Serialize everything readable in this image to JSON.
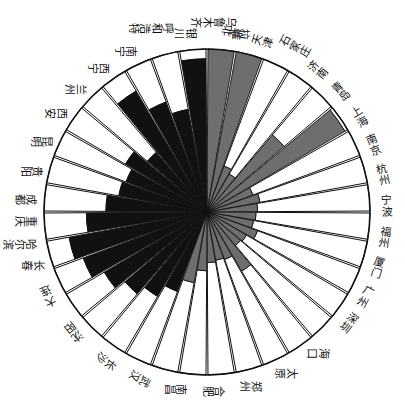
{
  "chart": {
    "title": "",
    "type_name": "radial-rose-chart",
    "center_x": 207,
    "center_y": 212,
    "outer_radius": 163,
    "start_angle_deg": -90,
    "sector_count": 36,
    "colors": {
      "fill_dark": "#111111",
      "fill_gray": "#6e6e6e",
      "fill_empty": "#ffffff",
      "stroke": "#111111",
      "label": "#111111",
      "background": "#ffffff"
    }
  },
  "chart_data": {
    "type": "bar",
    "title": "",
    "subtitle": "",
    "xlabel": "",
    "ylabel": "",
    "legend": [],
    "grid": false,
    "coordinate": "polar",
    "radial_max": 1.0,
    "note": "Each of 36 sectors is a city; value = inner filled radius as fraction of outer radius; group = fill color class",
    "categories": [
      "北京",
      "天津",
      "石家庄",
      "济南",
      "青岛",
      "上海",
      "南京",
      "杭州",
      "宁波",
      "福州",
      "厦门",
      "广州",
      "深圳",
      "海口",
      "太原",
      "郑州",
      "合肥",
      "南昌",
      "武汉",
      "长沙",
      "沈阳",
      "大连",
      "长春",
      "哈尔滨",
      "重庆",
      "成都",
      "贵阳",
      "昆明",
      "西安",
      "兰州",
      "西宁",
      "南宁",
      "呼和浩特",
      "银川",
      "乌鲁木齐",
      "拉萨"
    ],
    "values": [
      1.0,
      1.0,
      0.3,
      0.27,
      0.62,
      0.98,
      0.3,
      0.33,
      0.31,
      0.3,
      0.29,
      0.33,
      0.28,
      0.27,
      0.42,
      0.31,
      0.3,
      0.31,
      0.36,
      0.44,
      0.52,
      0.6,
      0.66,
      0.73,
      0.81,
      0.86,
      0.74,
      0.62,
      0.55,
      0.53,
      0.58,
      0.48,
      0.86,
      0.72,
      0.64,
      0.94
    ],
    "groups": [
      "gray",
      "gray",
      "gray",
      "gray",
      "gray",
      "gray",
      "gray",
      "gray",
      "gray",
      "gray",
      "gray",
      "gray",
      "gray",
      "gray",
      "gray",
      "gray",
      "gray",
      "gray",
      "gray",
      "gray",
      "dark",
      "dark",
      "dark",
      "dark",
      "dark",
      "dark",
      "dark",
      "dark",
      "dark",
      "dark",
      "dark",
      "dark",
      "dark",
      "dark",
      "dark",
      "dark"
    ],
    "series": [
      {
        "name": "inner-fill-fraction",
        "values": [
          1.0,
          1.0,
          0.3,
          0.27,
          0.62,
          0.98,
          0.3,
          0.33,
          0.31,
          0.3,
          0.29,
          0.33,
          0.28,
          0.27,
          0.42,
          0.31,
          0.3,
          0.31,
          0.36,
          0.44,
          0.52,
          0.6,
          0.66,
          0.73,
          0.81,
          0.86,
          0.74,
          0.62,
          0.55,
          0.53,
          0.58,
          0.48,
          0.86,
          0.72,
          0.64,
          0.94
        ]
      }
    ]
  },
  "labels": [
    {
      "text": "北京",
      "angle": -82,
      "rot": -82,
      "r": 182
    },
    {
      "text": "天津",
      "angle": -72,
      "rot": -72,
      "r": 180
    },
    {
      "text": "石家庄",
      "angle": -62,
      "rot": -62,
      "r": 188
    },
    {
      "text": "济南",
      "angle": -52,
      "rot": -52,
      "r": 180
    },
    {
      "text": "青岛",
      "angle": -42,
      "rot": -42,
      "r": 180
    },
    {
      "text": "上海",
      "angle": -32,
      "rot": -32,
      "r": 180
    },
    {
      "text": "南京",
      "angle": -22,
      "rot": -22,
      "r": 180
    },
    {
      "text": "杭州",
      "angle": -12,
      "rot": -12,
      "r": 180
    },
    {
      "text": "宁波",
      "angle": -2,
      "rot": -2,
      "r": 180
    },
    {
      "text": "福州",
      "angle": 8,
      "rot": 8,
      "r": 180
    },
    {
      "text": "厦门",
      "angle": 18,
      "rot": 18,
      "r": 180
    },
    {
      "text": "广州",
      "angle": 28,
      "rot": 28,
      "r": 180
    },
    {
      "text": "深圳",
      "angle": 38,
      "rot": 38,
      "r": 180
    },
    {
      "text": "海口",
      "angle": 52,
      "rot": 90,
      "r": 180
    },
    {
      "text": "太原",
      "angle": 64,
      "rot": 90,
      "r": 180
    },
    {
      "text": "郑州",
      "angle": 76,
      "rot": 90,
      "r": 180
    },
    {
      "text": "合肥",
      "angle": 88,
      "rot": 90,
      "r": 180
    },
    {
      "text": "南昌",
      "angle": 100,
      "rot": 90,
      "r": 180
    },
    {
      "text": "武汉",
      "angle": 112,
      "rot": 118,
      "r": 180
    },
    {
      "text": "长沙",
      "angle": 124,
      "rot": 128,
      "r": 180
    },
    {
      "text": "沈阳",
      "angle": 138,
      "rot": 142,
      "r": 180
    },
    {
      "text": "大连",
      "angle": 152,
      "rot": 156,
      "r": 180
    },
    {
      "text": "长春",
      "angle": 163,
      "rot": 90,
      "r": 182
    },
    {
      "text": "哈尔滨",
      "angle": 170,
      "rot": 90,
      "r": 190
    },
    {
      "text": "重庆",
      "angle": 177,
      "rot": 90,
      "r": 182
    },
    {
      "text": "成都",
      "angle": 184,
      "rot": 90,
      "r": 182
    },
    {
      "text": "贵阳",
      "angle": 193,
      "rot": 90,
      "r": 180
    },
    {
      "text": "昆明",
      "angle": 203,
      "rot": 90,
      "r": 180
    },
    {
      "text": "西安",
      "angle": 213,
      "rot": 90,
      "r": 180
    },
    {
      "text": "兰州",
      "angle": 223,
      "rot": 90,
      "r": 180
    },
    {
      "text": "西宁",
      "angle": 233,
      "rot": 90,
      "r": 180
    },
    {
      "text": "南宁",
      "angle": 243,
      "rot": 90,
      "r": 180
    },
    {
      "text": "呼和浩特",
      "angle": 253,
      "rot": 90,
      "r": 192
    },
    {
      "text": "银川",
      "angle": 263,
      "rot": 90,
      "r": 180
    },
    {
      "text": "乌鲁木齐",
      "angle": 272,
      "rot": 90,
      "r": 190
    },
    {
      "text": "拉萨",
      "angle": 280,
      "rot": 90,
      "r": 180
    }
  ]
}
